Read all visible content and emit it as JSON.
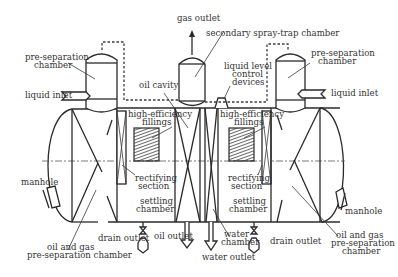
{
  "figure": {
    "colors": {
      "line": "#2a2a2a",
      "text": "#333333",
      "background": "#ffffff",
      "hatch": "#444444"
    }
  },
  "labels": {
    "gas_outlet": "gas outlet",
    "secondary_spray_trap_chamber": "secondary spray-trap chamber",
    "pre_separation_chamber_left_1": "pre-separation",
    "pre_separation_chamber_left_2": "chamber",
    "pre_separation_chamber_right_1": "pre-separation",
    "pre_separation_chamber_right_2": "chamber",
    "liquid_inlet_left": "liquid inlet",
    "liquid_inlet_right": "liquid inlet",
    "oil_cavity": "oil cavity",
    "liquid_level_control_1": "liquid level",
    "liquid_level_control_2": "control",
    "liquid_level_control_3": "devices",
    "high_efficiency_left_1": "high-efficiency",
    "high_efficiency_left_2": "fillings",
    "high_efficiency_right_1": "high-efficiency",
    "high_efficiency_right_2": "fillings",
    "manhole_left": "manhole",
    "manhole_right": "manhole",
    "rectifying_left_1": "rectifying",
    "rectifying_left_2": "section",
    "rectifying_right_1": "rectifying",
    "rectifying_right_2": "section",
    "settling_left_1": "settling",
    "settling_left_2": "chamber",
    "settling_right_1": "settling",
    "settling_right_2": "chamber",
    "oil_gas_pre_left_1": "oil and gas",
    "oil_gas_pre_left_2": "pre-separation chamber",
    "oil_gas_pre_right_1": "oil and gas",
    "oil_gas_pre_right_2": "pre-separation",
    "oil_gas_pre_right_3": "chamber",
    "drain_outlet_left": "drain outlet",
    "drain_outlet_right": "drain outlet",
    "oil_outlet": "oil outlet",
    "water_outlet": "water outlet",
    "water_chamber_1": "water",
    "water_chamber_2": "chamber"
  }
}
